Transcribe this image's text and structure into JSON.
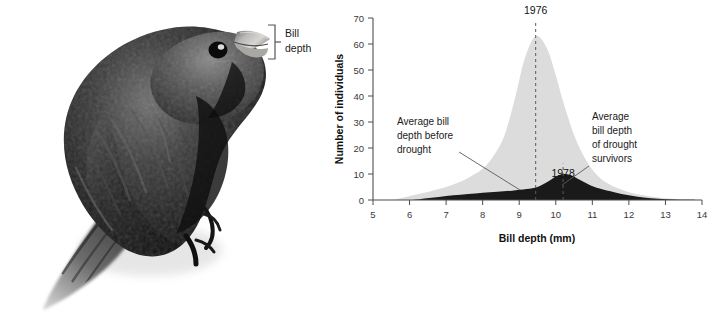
{
  "figure": {
    "width": 725,
    "height": 315,
    "background": "#ffffff"
  },
  "photo_panel": {
    "subject_name": "darwins-finch-photograph",
    "description": "Black-plumaged medium ground finch perched, shown in grayscale",
    "measure_label_line1": "Bill",
    "measure_label_line2": "depth",
    "bracket_color": "#555555"
  },
  "chart_data": {
    "type": "area",
    "title": "",
    "xlabel": "Bill depth (mm)",
    "ylabel": "Number of individuals",
    "xlim": [
      5,
      14
    ],
    "ylim": [
      0,
      70
    ],
    "xticks": [
      5,
      6,
      7,
      8,
      9,
      10,
      11,
      12,
      13,
      14
    ],
    "xtick_labels": [
      "5",
      "6",
      "7",
      "8",
      "9",
      "10",
      "11",
      "12",
      "13",
      "14"
    ],
    "yticks": [
      0,
      10,
      20,
      30,
      40,
      50,
      60,
      70
    ],
    "ytick_labels": [
      "0",
      "10",
      "20",
      "30",
      "40",
      "50",
      "60",
      "70"
    ],
    "grid": false,
    "legend_position": "none",
    "series": [
      {
        "name": "1976",
        "label": "1976",
        "color": "#dcdcdc",
        "mean_x": 9.45,
        "peak_value": 63,
        "x": [
          5.0,
          5.5,
          5.7,
          6.0,
          6.3,
          6.6,
          7.0,
          7.3,
          7.6,
          8.0,
          8.3,
          8.6,
          8.9,
          9.1,
          9.3,
          9.45,
          9.6,
          9.8,
          10.0,
          10.2,
          10.5,
          10.8,
          11.1,
          11.4,
          11.7,
          12.0,
          12.4,
          12.8,
          13.2,
          13.6,
          14.0
        ],
        "values": [
          0,
          0,
          0.5,
          1.5,
          2.5,
          3.5,
          5,
          6.5,
          8.5,
          12,
          17,
          25,
          40,
          52,
          60,
          63,
          62,
          57,
          48,
          38,
          25,
          16,
          10,
          6.5,
          4.5,
          3,
          1.8,
          1.0,
          0.5,
          0.2,
          0
        ]
      },
      {
        "name": "1978",
        "label": "1978",
        "color": "#1a1a1a",
        "mean_x": 10.2,
        "peak_value": 10,
        "x": [
          5.0,
          6.0,
          6.4,
          6.8,
          7.2,
          7.6,
          8.0,
          8.4,
          8.8,
          9.2,
          9.5,
          9.8,
          10.0,
          10.2,
          10.4,
          10.6,
          10.9,
          11.2,
          11.6,
          12.0,
          12.4,
          12.8,
          13.2,
          13.6,
          14.0
        ],
        "values": [
          0,
          0,
          0.6,
          1.2,
          1.8,
          2.3,
          2.8,
          3.2,
          3.6,
          4.2,
          5.0,
          7.2,
          9.0,
          10.0,
          9.6,
          8.2,
          6.0,
          4.4,
          3.0,
          1.8,
          1.0,
          0.5,
          0.2,
          0.1,
          0
        ]
      }
    ],
    "annotations": [
      {
        "name": "average-bill-depth-before-drought",
        "lines": [
          "Average bill",
          "depth before",
          "drought"
        ],
        "points_to_x": 9.0,
        "points_to_y": 3.5
      },
      {
        "name": "average-bill-depth-of-drought-survivors",
        "lines": [
          "Average",
          "bill depth",
          "of drought",
          "survivors"
        ],
        "points_to_x": 10.45,
        "points_to_y": 7.5
      }
    ],
    "reference_lines": [
      {
        "name": "mean-1976",
        "x": 9.45,
        "label": "1976",
        "style": "dashed"
      },
      {
        "name": "mean-1978",
        "x": 10.2,
        "label": "1978",
        "style": "dashed"
      }
    ]
  }
}
